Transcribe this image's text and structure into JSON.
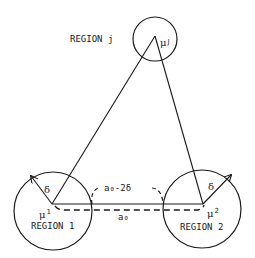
{
  "diagram": {
    "regions": [
      {
        "id": "j",
        "label": "REGION j",
        "center_label": "μ",
        "center_sup": "J",
        "cx": 155,
        "cy": 39,
        "r": 22
      },
      {
        "id": "1",
        "label": "REGION 1",
        "center_label": "μ",
        "center_sup": "1",
        "cx": 53,
        "cy": 211,
        "r": 39
      },
      {
        "id": "2",
        "label": "REGION 2",
        "center_label": "μ",
        "center_sup": "2",
        "cx": 202,
        "cy": 209,
        "r": 39
      }
    ],
    "radius_label_left": "δ",
    "radius_label_right": "δ",
    "inner_distance_label": "a₀-2δ",
    "center_distance_label": "a₀"
  },
  "colors": {
    "stroke": "#1a1a1a",
    "background": "#ffffff"
  }
}
